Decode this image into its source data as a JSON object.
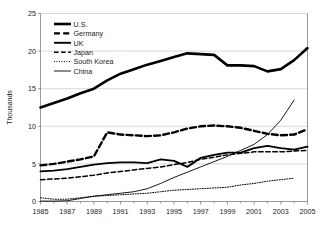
{
  "chart_data": {
    "type": "line",
    "title": "",
    "subtitle": "",
    "xlabel": "",
    "ylabel": "Thousands",
    "xlim": [
      1985,
      2005
    ],
    "ylim": [
      0,
      25
    ],
    "yticks": [
      0,
      5,
      10,
      15,
      20,
      25
    ],
    "ytick_labels": [
      "0",
      "5",
      "10",
      "15",
      "20",
      "25"
    ],
    "xticks": [
      1985,
      1987,
      1989,
      1991,
      1993,
      1995,
      1997,
      1999,
      2001,
      2003,
      2005
    ],
    "xtick_labels": [
      "1985",
      "1987",
      "1989",
      "1991",
      "1993",
      "1995",
      "1997",
      "1999",
      "2001",
      "2003",
      "2005"
    ],
    "minor_xticks_every": 1,
    "grid": "horizontal",
    "legend_position": "top-left",
    "x": [
      1985,
      1986,
      1987,
      1988,
      1989,
      1990,
      1991,
      1992,
      1993,
      1994,
      1995,
      1996,
      1997,
      1998,
      1999,
      2000,
      2001,
      2002,
      2003,
      2004,
      2005
    ],
    "series": [
      {
        "name": "U.S.",
        "style": "solid-thick",
        "color": "#000000",
        "values": [
          12.5,
          13.1,
          13.7,
          14.4,
          15.0,
          16.1,
          17.0,
          17.6,
          18.2,
          18.7,
          19.2,
          19.7,
          19.6,
          19.5,
          18.1,
          18.1,
          18.0,
          17.3,
          17.6,
          18.8,
          20.4
        ]
      },
      {
        "name": "Germany",
        "style": "dashed-thick",
        "color": "#000000",
        "values": [
          4.8,
          5.0,
          5.3,
          5.6,
          6.0,
          9.2,
          8.9,
          8.8,
          8.7,
          8.8,
          9.2,
          9.7,
          10.0,
          10.1,
          10.0,
          9.8,
          9.4,
          9.0,
          8.8,
          8.9,
          9.6
        ]
      },
      {
        "name": "UK",
        "style": "solid-medium",
        "color": "#000000",
        "values": [
          4.0,
          4.1,
          4.3,
          4.6,
          4.9,
          5.1,
          5.2,
          5.2,
          5.1,
          5.6,
          5.4,
          4.6,
          5.8,
          6.2,
          6.5,
          6.5,
          7.1,
          7.4,
          7.1,
          6.9,
          7.3
        ]
      },
      {
        "name": "Japan",
        "style": "dashed-medium",
        "color": "#000000",
        "values": [
          2.9,
          3.0,
          3.1,
          3.3,
          3.5,
          3.8,
          4.0,
          4.2,
          4.4,
          4.6,
          4.9,
          5.2,
          5.6,
          5.9,
          6.2,
          6.4,
          6.6,
          6.6,
          6.6,
          6.7,
          6.8
        ]
      },
      {
        "name": "South Korea",
        "style": "dotted",
        "color": "#000000",
        "values": [
          0.5,
          0.3,
          0.3,
          0.5,
          0.7,
          0.8,
          0.9,
          1.0,
          1.1,
          1.3,
          1.5,
          1.6,
          1.7,
          1.8,
          1.9,
          2.2,
          2.4,
          2.7,
          2.9,
          3.1,
          null
        ]
      },
      {
        "name": "China",
        "style": "solid-thin",
        "color": "#000000",
        "values": [
          0.05,
          0.05,
          0.1,
          0.4,
          0.7,
          0.9,
          1.1,
          1.3,
          1.7,
          2.4,
          3.2,
          3.9,
          4.6,
          5.3,
          6.0,
          6.8,
          7.6,
          8.9,
          10.8,
          13.5,
          null
        ]
      }
    ]
  },
  "legend": {
    "items": [
      {
        "label": "U.S."
      },
      {
        "label": "Germany"
      },
      {
        "label": "UK"
      },
      {
        "label": "Japan"
      },
      {
        "label": "South Korea"
      },
      {
        "label": "China"
      }
    ]
  }
}
